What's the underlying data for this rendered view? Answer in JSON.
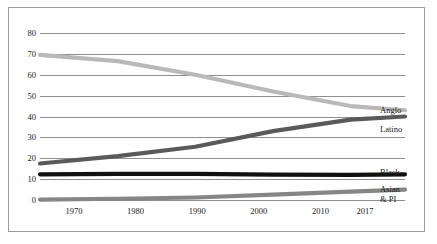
{
  "chart_data": {
    "type": "line",
    "title": "",
    "subtitle": "",
    "xlabel": "",
    "ylabel": "",
    "x": [
      1970,
      1980,
      1990,
      2000,
      2010,
      2017
    ],
    "xtick_labels": [
      "1970",
      "1980",
      "1990",
      "2000",
      "2010",
      "2017"
    ],
    "ytick_labels": [
      "0",
      "10",
      "20",
      "30",
      "40",
      "50",
      "60",
      "70",
      "80"
    ],
    "yticks": [
      0,
      10,
      20,
      30,
      40,
      50,
      60,
      70,
      80
    ],
    "ylim": [
      0,
      80
    ],
    "xlim": [
      1970,
      2017
    ],
    "grid": "horizontal",
    "legend_position": "right-inline-end-of-line",
    "series": [
      {
        "name": "Anglo",
        "label": "Anglo",
        "color": "#b9b9b9",
        "values": [
          69.5,
          66.5,
          60.0,
          52.0,
          45.0,
          43.0
        ]
      },
      {
        "name": "Latino",
        "label": "Latino",
        "color": "#5a5a5a",
        "values": [
          17.5,
          21.0,
          25.5,
          33.0,
          38.5,
          40.0
        ]
      },
      {
        "name": "Black",
        "label": "Black",
        "color": "#111111",
        "values": [
          12.3,
          12.5,
          12.5,
          12.2,
          12.0,
          12.3
        ]
      },
      {
        "name": "Asian & PI",
        "label": "Asian\n& PI",
        "color": "#868686",
        "values": [
          0.2,
          0.6,
          1.2,
          2.6,
          4.0,
          5.0
        ]
      }
    ]
  },
  "style": {
    "background": "#ffffff",
    "frame_color": "#9a9a9a",
    "gridline_color": "#8f8f8f",
    "text_color": "#1a1a1a"
  }
}
